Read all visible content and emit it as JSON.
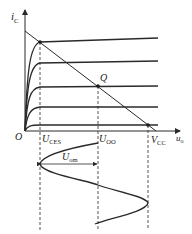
{
  "diagram": {
    "axes": {
      "y_label": {
        "main": "i",
        "sub": "C"
      },
      "x_label": {
        "main": "u",
        "sub": "o"
      },
      "origin_label": "O"
    },
    "markers": {
      "u_ces": {
        "main": "U",
        "sub": "CES"
      },
      "u_oo": {
        "main": "U",
        "sub": "OO"
      },
      "v_cc": {
        "main": "V",
        "sub": "CC"
      },
      "q_point": "Q",
      "u_om": {
        "main": "U",
        "sub": "om"
      }
    },
    "characteristic_curves_count": 5,
    "colors": {
      "line": "#2a2a2a",
      "background": "#ffffff"
    }
  }
}
